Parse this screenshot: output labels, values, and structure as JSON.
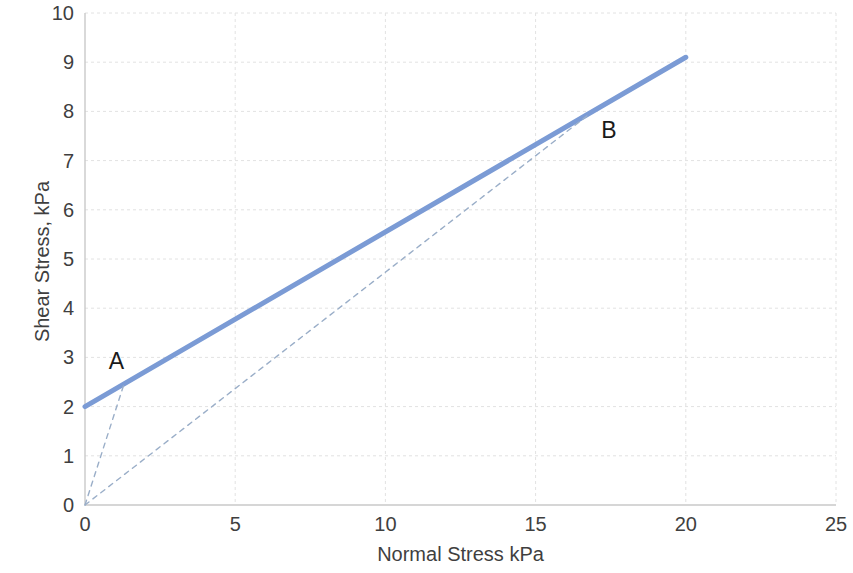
{
  "chart_data": {
    "type": "line",
    "title": "",
    "xlabel": "Normal Stress kPa",
    "ylabel": "Shear Stress, kPa",
    "xlim": [
      0,
      25
    ],
    "ylim": [
      0,
      10
    ],
    "xticks": [
      0,
      5,
      10,
      15,
      20,
      25
    ],
    "yticks": [
      0,
      1,
      2,
      3,
      4,
      5,
      6,
      7,
      8,
      9,
      10
    ],
    "grid": true,
    "legend": "none",
    "series": [
      {
        "name": "failure-envelope",
        "style": "solid",
        "color": "#7B9BD5",
        "width": 5,
        "points": [
          [
            0,
            2.0
          ],
          [
            20,
            9.1
          ]
        ]
      },
      {
        "name": "stress-path-to-A",
        "style": "dashed",
        "color": "#9AAEC8",
        "width": 1.4,
        "points": [
          [
            0,
            0
          ],
          [
            1.3,
            2.46
          ]
        ]
      },
      {
        "name": "stress-path-to-B",
        "style": "dashed",
        "color": "#9AAEC8",
        "width": 1.4,
        "points": [
          [
            0,
            0
          ],
          [
            16.8,
            7.95
          ]
        ]
      }
    ],
    "annotations": [
      {
        "text": "A",
        "x": 1.05,
        "y": 2.92
      },
      {
        "text": "B",
        "x": 17.45,
        "y": 7.62
      }
    ]
  },
  "axes": {
    "x_title": "Normal Stress kPa",
    "y_title": "Shear Stress, kPa",
    "x_tick_labels": [
      "0",
      "5",
      "10",
      "15",
      "20",
      "25"
    ],
    "y_tick_labels": [
      "0",
      "1",
      "2",
      "3",
      "4",
      "5",
      "6",
      "7",
      "8",
      "9",
      "10"
    ]
  },
  "annotations": {
    "a_label": "A",
    "b_label": "B"
  },
  "colors": {
    "envelope": "#7B9BD5",
    "dashed": "#9AAEC8",
    "grid": "#E2E2E2",
    "axis": "#C9C9C9",
    "text": "#3f3f3f"
  }
}
